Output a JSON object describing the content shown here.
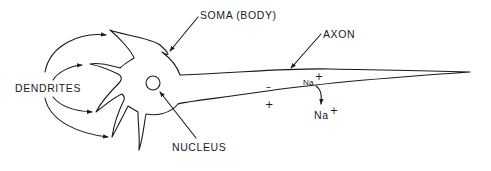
{
  "labels": {
    "soma": "SOMA (BODY)",
    "axon": "AXON",
    "dendrites": "DENDRITES",
    "nucleus": "NUCLEUS"
  },
  "ions": {
    "inside_na": "Na",
    "inside_charge": "+",
    "outside_na": "Na",
    "outside_charge": "+"
  },
  "membrane_charges": {
    "inside": "–",
    "outside": "+"
  },
  "colors": {
    "line": "#1a1a1a",
    "background": "#ffffff"
  }
}
